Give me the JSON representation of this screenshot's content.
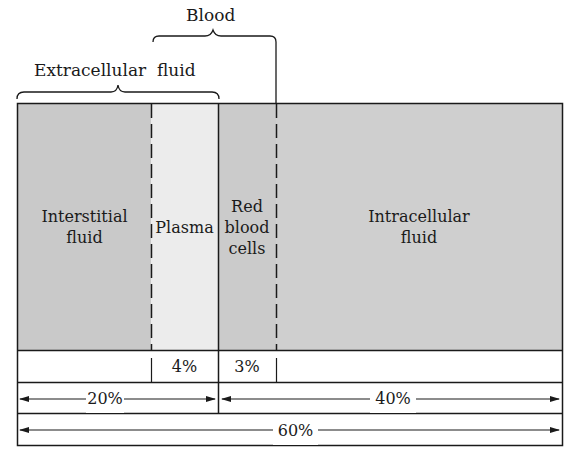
{
  "diagram": {
    "top_labels": {
      "blood": "Blood",
      "extracellular": "Extracellular",
      "fluid": "fluid"
    },
    "compartments": [
      {
        "id": "interstitial",
        "line1": "Interstitial",
        "line2": "fluid",
        "color": "#c9c9c9"
      },
      {
        "id": "plasma",
        "line1": "Plasma",
        "line2": "",
        "color": "#ececec"
      },
      {
        "id": "rbc",
        "line1": "Red",
        "line2": "blood",
        "line3": "cells",
        "color": "#cbcbcb"
      },
      {
        "id": "intracellular",
        "line1": "Intracellular",
        "line2": "fluid",
        "color": "#cfcfcf"
      }
    ],
    "percent_row": {
      "plasma": "4%",
      "rbc": "3%"
    },
    "range_row": {
      "extracellular": "20%",
      "intracellular": "40%"
    },
    "total_row": {
      "total": "60%"
    }
  }
}
